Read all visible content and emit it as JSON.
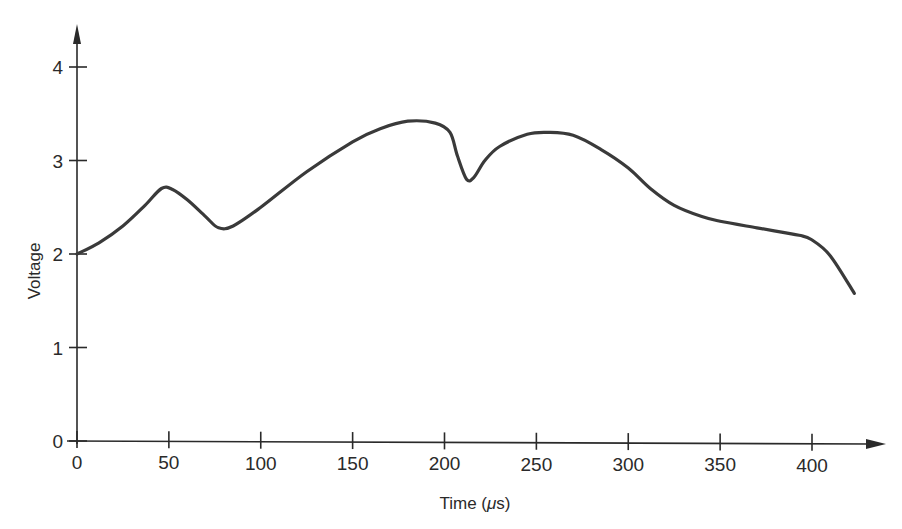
{
  "chart_data": {
    "type": "line",
    "title": "",
    "xlabel": "Time (μs)",
    "xlabel_prefix": "Time (",
    "xlabel_unit": "μ",
    "xlabel_suffix": "s)",
    "ylabel": "Voltage",
    "xlim": [
      0,
      430
    ],
    "ylim": [
      0,
      4.2
    ],
    "grid": false,
    "legend": null,
    "x_ticks": [
      0,
      50,
      100,
      150,
      200,
      250,
      300,
      350,
      400
    ],
    "y_ticks": [
      0,
      1,
      2,
      3,
      4
    ],
    "x_tick_labels": [
      "0",
      "50",
      "100",
      "150",
      "200",
      "250",
      "300",
      "350",
      "400"
    ],
    "y_tick_labels": [
      "0",
      "1",
      "2",
      "3",
      "4"
    ],
    "series": [
      {
        "name": "Voltage",
        "color": "#3a3a3a",
        "x": [
          0,
          12,
          25,
          37,
          46,
          52,
          60,
          70,
          77,
          85,
          100,
          125,
          150,
          165,
          180,
          195,
          203,
          207,
          212,
          216,
          222,
          230,
          245,
          256,
          270,
          285,
          300,
          312,
          325,
          340,
          350,
          370,
          393,
          400,
          410,
          423
        ],
        "y": [
          2.0,
          2.12,
          2.3,
          2.52,
          2.7,
          2.69,
          2.58,
          2.4,
          2.28,
          2.3,
          2.5,
          2.88,
          3.2,
          3.34,
          3.42,
          3.4,
          3.3,
          3.05,
          2.8,
          2.82,
          3.0,
          3.15,
          3.28,
          3.3,
          3.27,
          3.12,
          2.92,
          2.7,
          2.52,
          2.4,
          2.35,
          2.28,
          2.2,
          2.15,
          1.98,
          1.58
        ]
      }
    ]
  },
  "colors": {
    "axis": "#2a2a2a",
    "line": "#3a3a3a",
    "background": "#ffffff"
  }
}
